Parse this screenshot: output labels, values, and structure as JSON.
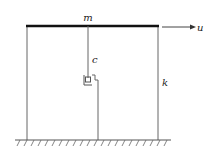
{
  "diagram": {
    "type": "single-storey shear frame with damper",
    "labels": {
      "mass": "m",
      "damper": "c",
      "stiffness": "k",
      "displacement": "u"
    },
    "colors": {
      "line": "#555555",
      "beam": "#111111",
      "text": "#222222"
    }
  }
}
